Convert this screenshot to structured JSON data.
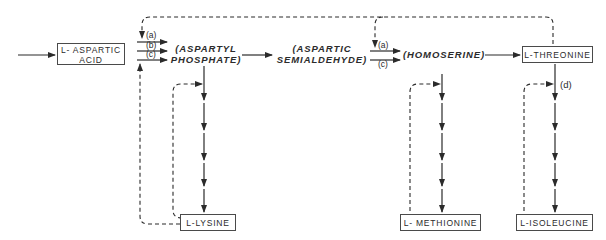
{
  "diagram": {
    "nodes": {
      "aspartic_acid": {
        "line1": "L- ASPARTIC",
        "line2": "ACID"
      },
      "aspartyl_phosphate": {
        "line1": "(ASPARTYL",
        "line2": "PHOSPHATE)"
      },
      "aspartic_semialdehyde": {
        "line1": "(ASPARTIC",
        "line2": "SEMIALDEHYDE)"
      },
      "homoserine": {
        "label": "(HOMOSERINE)"
      },
      "threonine": {
        "label": "L-THREONINE"
      },
      "lysine": {
        "label": "L-LYSINE"
      },
      "methionine": {
        "label": "L- METHIONINE"
      },
      "isoleucine": {
        "label": "L-ISOLEUCINE"
      }
    },
    "enzyme_labels": {
      "asp_a": "(a)",
      "asp_b": "(b)",
      "asp_c": "(c)",
      "hom_a": "(a)",
      "hom_c": "(c)",
      "ile_d": "(d)"
    },
    "edge_style": {
      "solid": "reaction step",
      "dashed": "feedback inhibition"
    },
    "colors": {
      "line": "#2b2b2b",
      "box_border": "#4a4a4a",
      "background": "#ffffff"
    }
  }
}
